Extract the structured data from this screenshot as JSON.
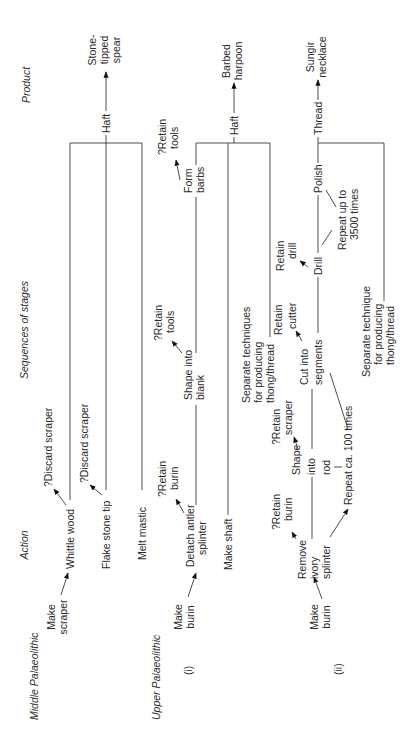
{
  "headers": {
    "action": "Action",
    "sequences": "Sequences of stages",
    "product": "Product"
  },
  "middle": {
    "title": "Middle Palaeolithic",
    "make_scraper": [
      "Make",
      "scraper"
    ],
    "whittle": "Whittle wood",
    "discard1": "?Discard scraper",
    "flake": "Flake stone tip",
    "discard2": "?Discard scraper",
    "melt": "Melt mastic",
    "haft": "Haft",
    "product": [
      "Stone-",
      "tipped",
      "spear"
    ]
  },
  "upper": {
    "title": "Upper Palaeolithic",
    "i": {
      "label": "(i)",
      "make_burin": [
        "Make",
        "burin"
      ],
      "detach": [
        "Detach antler",
        "splinter"
      ],
      "retain_burin": [
        "?Retain",
        "burin"
      ],
      "shape_blank": [
        "Shape into",
        "blank"
      ],
      "retain_tools1": [
        "?Retain",
        "tools"
      ],
      "form_barbs": [
        "Form",
        "barbs"
      ],
      "retain_tools2": [
        "?Retain",
        "tools"
      ],
      "make_shaft": "Make shaft",
      "separate": [
        "Separate techniques",
        "for producing",
        "thong/thread"
      ],
      "haft": "Haft",
      "product": [
        "Barbed",
        "harpoon"
      ]
    },
    "ii": {
      "label": "(ii)",
      "make_burin": [
        "Make",
        "burin"
      ],
      "remove": [
        "Remove",
        "ivory",
        "splinter"
      ],
      "retain_burin": [
        "?Retain",
        "burin"
      ],
      "shape_rod": [
        "Shape",
        "into",
        "rod"
      ],
      "retain_scraper": [
        "?Retain",
        "scraper"
      ],
      "repeat100": "Repeat ca. 100 times",
      "cut": [
        "Cut into",
        "segments"
      ],
      "retain_cutter": [
        "Retain",
        "cutter"
      ],
      "drill": "Drill",
      "retain_drill": [
        "Retain",
        "drill"
      ],
      "polish": "Polish",
      "repeat3500": [
        "Repeat up to",
        "3500 times"
      ],
      "separate": [
        "Separate technique",
        "for producing",
        "thong/thread"
      ],
      "thread": "Thread",
      "product": [
        "Sungir",
        "necklace"
      ]
    }
  }
}
